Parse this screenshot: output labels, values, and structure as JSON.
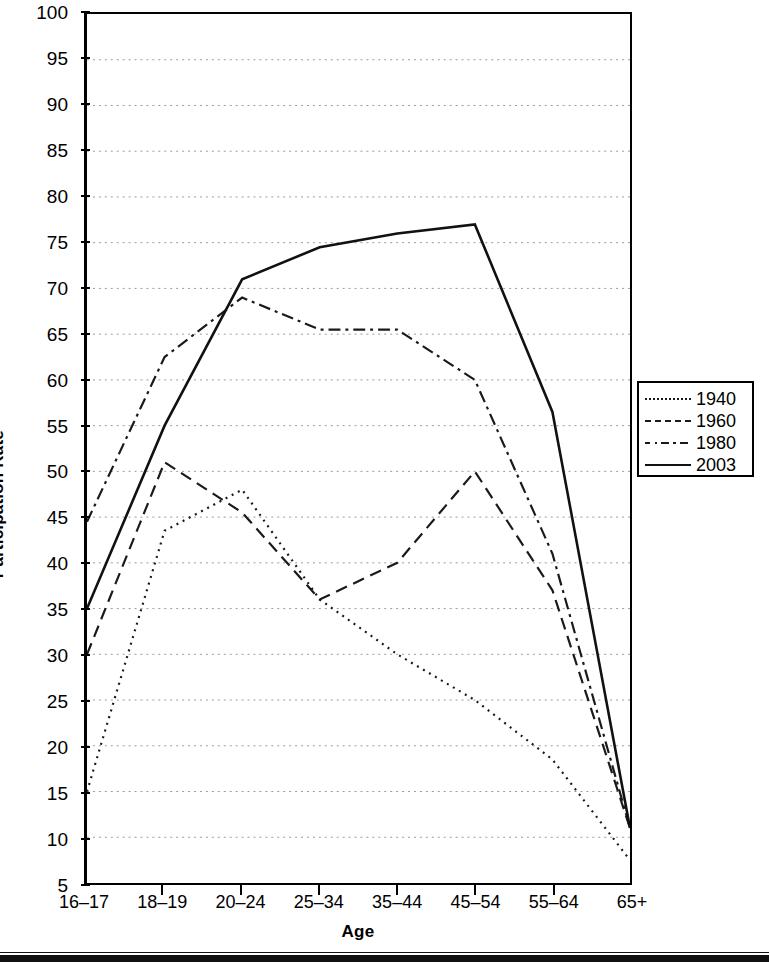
{
  "chart_data": {
    "type": "line",
    "title": "",
    "xlabel": "Age",
    "ylabel": "Participation Rate",
    "categories": [
      "16–17",
      "18–19",
      "20–24",
      "25–34",
      "35–44",
      "45–54",
      "55–64",
      "65+"
    ],
    "ylim": [
      5,
      100
    ],
    "ytick_step": 5,
    "yticks": [
      5,
      10,
      15,
      20,
      25,
      30,
      35,
      40,
      45,
      50,
      55,
      60,
      65,
      70,
      75,
      80,
      85,
      90,
      95,
      100
    ],
    "grid": true,
    "grid_style": "dotted-horizontal",
    "legend_position": "right-outside",
    "series": [
      {
        "name": "1940",
        "style": "dotted",
        "color": "#1a1a1a",
        "values": [
          15,
          43.5,
          48,
          36,
          30,
          25,
          18.5,
          7.5
        ]
      },
      {
        "name": "1960",
        "style": "dashed",
        "color": "#1a1a1a",
        "values": [
          30,
          51,
          45.5,
          36,
          40,
          50,
          37,
          11
        ]
      },
      {
        "name": "1980",
        "style": "dash-dot",
        "color": "#1a1a1a",
        "values": [
          44.5,
          62.5,
          69,
          65.5,
          65.5,
          60,
          41,
          11
        ]
      },
      {
        "name": "2003",
        "style": "solid",
        "color": "#111111",
        "values": [
          35,
          55,
          71,
          74.5,
          76,
          77,
          56.5,
          11
        ]
      }
    ]
  },
  "axis": {
    "ylabel": "Participation Rate",
    "xlabel": "Age",
    "ytick_labels": [
      "100",
      "95",
      "90",
      "85",
      "80",
      "75",
      "70",
      "65",
      "60",
      "55",
      "50",
      "45",
      "40",
      "35",
      "30",
      "25",
      "20",
      "15",
      "10",
      "5"
    ],
    "xtick_labels": [
      "16–17",
      "18–19",
      "20–24",
      "25–34",
      "35–44",
      "45–54",
      "55–64",
      "65+"
    ]
  },
  "legend": {
    "items": [
      {
        "label": "1940",
        "style": "dotted"
      },
      {
        "label": "1960",
        "style": "dashed"
      },
      {
        "label": "1980",
        "style": "dash-dot"
      },
      {
        "label": "2003",
        "style": "solid"
      }
    ]
  }
}
